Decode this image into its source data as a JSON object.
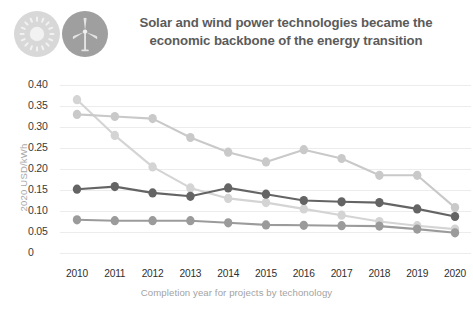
{
  "header": {
    "title_line1": "Solar and wind power technologies became the",
    "title_line2": "economic backbone of the energy transition",
    "icons": [
      {
        "name": "solar-sun-icon",
        "color": "#d8d8d8"
      },
      {
        "name": "wind-turbine-icon",
        "color": "#9f9f9f"
      }
    ]
  },
  "chart_data": {
    "type": "line",
    "title": "Solar and wind power technologies became the economic backbone of the energy transition",
    "xlabel": "Completion year for projects by techonology",
    "ylabel": "2020 USD/kWh",
    "categories": [
      "2010",
      "2011",
      "2012",
      "2013",
      "2014",
      "2015",
      "2016",
      "2017",
      "2018",
      "2019",
      "2020"
    ],
    "x": [
      2010,
      2011,
      2012,
      2013,
      2014,
      2015,
      2016,
      2017,
      2018,
      2019,
      2020
    ],
    "ylim": [
      0,
      0.4
    ],
    "yticks": [
      "0.40",
      "0.35",
      "0.30",
      "0.25",
      "0.20",
      "0.15",
      "0.10",
      "0.05",
      "0"
    ],
    "ytick_values": [
      0.4,
      0.35,
      0.3,
      0.25,
      0.2,
      0.15,
      0.1,
      0.05,
      0
    ],
    "grid": true,
    "legend": "none",
    "series": [
      {
        "name": "series-light-declining",
        "color": "#d4d4d4",
        "values": [
          0.365,
          0.28,
          0.205,
          0.155,
          0.13,
          0.12,
          0.105,
          0.09,
          0.075,
          0.065,
          0.057
        ]
      },
      {
        "name": "series-light-peak-2016",
        "color": "#c9c9c9",
        "values": [
          0.33,
          0.325,
          0.32,
          0.275,
          0.24,
          0.217,
          0.246,
          0.225,
          0.185,
          0.185,
          0.108
        ]
      },
      {
        "name": "series-dark",
        "color": "#646464",
        "values": [
          0.152,
          0.158,
          0.143,
          0.135,
          0.155,
          0.14,
          0.125,
          0.122,
          0.12,
          0.105,
          0.087
        ]
      },
      {
        "name": "series-mid-gray-low",
        "color": "#9b9b9b",
        "values": [
          0.079,
          0.077,
          0.077,
          0.077,
          0.072,
          0.067,
          0.066,
          0.065,
          0.064,
          0.057,
          0.048
        ]
      }
    ]
  }
}
